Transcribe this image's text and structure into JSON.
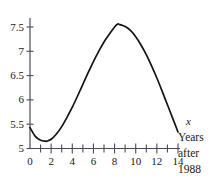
{
  "chart_data": {
    "type": "line",
    "title": "",
    "subtitle": "",
    "xlabel": "x",
    "xlabel_caption_lines": [
      "Years",
      "after",
      "1988"
    ],
    "ylabel": "",
    "xlim": [
      0,
      14
    ],
    "ylim": [
      5,
      7.75
    ],
    "grid": false,
    "legend": null,
    "x_major_ticks": [
      0,
      2,
      4,
      6,
      8,
      10,
      12,
      14
    ],
    "x_major_tick_labels": [
      "0",
      "2",
      "4",
      "6",
      "8",
      "10",
      "12",
      "14"
    ],
    "x_minor_ticks": [
      1,
      3,
      5,
      7,
      9,
      11,
      13
    ],
    "y_major_ticks": [
      5,
      5.5,
      6,
      6.5,
      7,
      7.5
    ],
    "y_major_tick_labels": [
      "5",
      "5.5",
      "6",
      "6.5",
      "7",
      "7.5"
    ],
    "series": [
      {
        "name": "curve",
        "color": "#141414",
        "x": [
          0,
          0.5,
          1,
          1.5,
          1.6,
          2,
          2.5,
          3,
          3.5,
          4,
          4.5,
          5,
          5.5,
          6,
          6.5,
          7,
          7.5,
          8,
          8.3,
          8.5,
          9,
          9.5,
          10,
          10.5,
          11,
          11.5,
          12,
          12.5,
          13,
          13.5,
          14
        ],
        "y": [
          5.43,
          5.25,
          5.17,
          5.15,
          5.15,
          5.19,
          5.3,
          5.45,
          5.64,
          5.85,
          6.08,
          6.32,
          6.56,
          6.79,
          7.0,
          7.19,
          7.35,
          7.5,
          7.56,
          7.55,
          7.51,
          7.43,
          7.3,
          7.13,
          6.93,
          6.7,
          6.45,
          6.18,
          5.9,
          5.62,
          5.34
        ]
      }
    ],
    "annotations": {
      "minimum": {
        "x": 1.6,
        "y": 5.15
      },
      "maximum": {
        "x": 8.3,
        "y": 7.56
      },
      "start": {
        "x": 0,
        "y": 5.43
      },
      "end": {
        "x": 14,
        "y": 5.34
      }
    }
  },
  "axis_label": {
    "variable": "x",
    "caption": [
      "Years",
      "after",
      "1988"
    ]
  },
  "colors": {
    "background": "#ffffff",
    "axis": "#4a4a5a",
    "curve": "#141414",
    "text": "#1a1a1a"
  }
}
